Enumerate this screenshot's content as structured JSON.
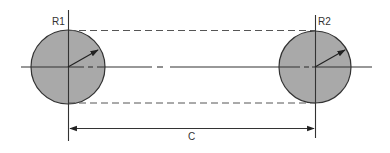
{
  "diagram": {
    "colors": {
      "fill": "#a9a9a9",
      "stroke": "#333333",
      "dashed": "#555555",
      "background": "#ffffff"
    },
    "circles": [
      {
        "id": "circle-1",
        "label": "R1",
        "cx": 68,
        "cy": 67,
        "r": 37
      },
      {
        "id": "circle-2",
        "label": "R2",
        "cx": 315,
        "cy": 67,
        "r": 36
      }
    ],
    "dimension": {
      "label": "C",
      "y": 128,
      "from_x": 68,
      "to_x": 315
    },
    "tangent_lines": {
      "top_y": 30,
      "bottom_y": 103
    },
    "labels": {
      "r1": "R1",
      "r2": "R2",
      "c": "C"
    }
  }
}
